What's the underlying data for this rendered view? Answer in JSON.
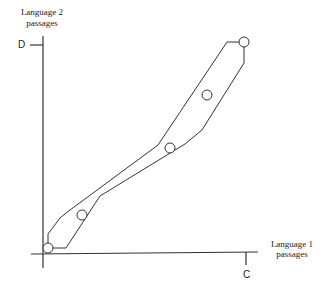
{
  "diagram": {
    "y_axis": {
      "label_line1": "Language 2",
      "label_line2": "passages",
      "tick_label": "D"
    },
    "x_axis": {
      "label_line1": "Language 1",
      "label_line2": "passages",
      "tick_label": "C"
    },
    "envelope_polygon": [
      [
        44,
        238
      ],
      [
        44,
        222
      ],
      [
        68,
        202
      ],
      [
        158,
        146
      ],
      [
        227,
        42
      ],
      [
        244,
        42
      ],
      [
        244,
        62
      ],
      [
        180,
        152
      ],
      [
        82,
        232
      ],
      [
        66,
        248
      ],
      [
        52,
        248
      ]
    ],
    "points": [
      {
        "cx": 48,
        "cy": 248,
        "r": 5
      },
      {
        "cx": 82,
        "cy": 215,
        "r": 5
      },
      {
        "cx": 170,
        "cy": 148,
        "r": 5
      },
      {
        "cx": 207,
        "cy": 95,
        "r": 5
      },
      {
        "cx": 244,
        "cy": 42,
        "r": 5
      }
    ],
    "colors": {
      "stroke": "#333333",
      "background": "#ffffff"
    }
  }
}
